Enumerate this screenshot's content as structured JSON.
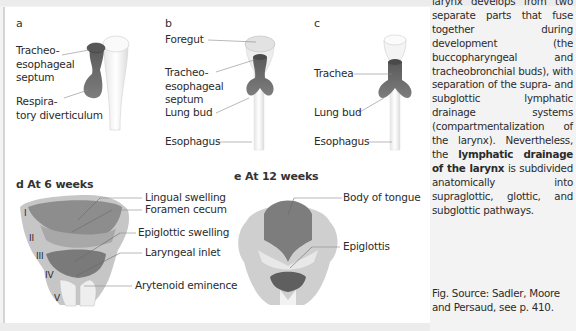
{
  "figure": {
    "panels": {
      "a": {
        "letter": "a",
        "labels": [
          "Tracheo-\nesophageal\nseptum",
          "Respira-\ntory diverticulum"
        ]
      },
      "b": {
        "letter": "b",
        "labels": [
          "Foregut",
          "Tracheo-\nesophageal\nseptum",
          "Lung bud",
          "Esophagus"
        ]
      },
      "c": {
        "letter": "c",
        "labels": [
          "Trachea",
          "Lung bud",
          "Esophagus"
        ]
      },
      "d": {
        "title": "d  At 6 weeks",
        "arch_numerals": [
          "I",
          "II",
          "III",
          "IV",
          "V"
        ],
        "labels": [
          "Lingual swelling",
          "Foramen cecum",
          "Epiglottic swelling",
          "Laryngeal inlet",
          "Arytenoid eminence"
        ]
      },
      "e": {
        "title": "e  At 12 weeks",
        "labels": [
          "Body of tongue",
          "Epiglottis"
        ]
      }
    },
    "colors": {
      "tissue_dark": "#6e6e6e",
      "tissue_mid": "#9a9a9a",
      "tissue_light": "#c4c4c4",
      "tube_white": "#f2f2f2",
      "leader_line": "#8a8a8a"
    }
  },
  "body_text": {
    "pre": "larynx develops from two separate parts that fuse together during development (the buccopharyngeal and tracheobronchial buds), with separation of the supra- and subglottic lymphatic drainage systems (compartmentalization of the larynx). Nevertheless, the ",
    "bold": "lymphatic drainage of the larynx",
    "post": " is subdivided anatomically into supraglottic, glottic, and subglottic pathways."
  },
  "source": {
    "text": "Fig. Source: Sadler, Moore and Persaud, see p. 410."
  }
}
